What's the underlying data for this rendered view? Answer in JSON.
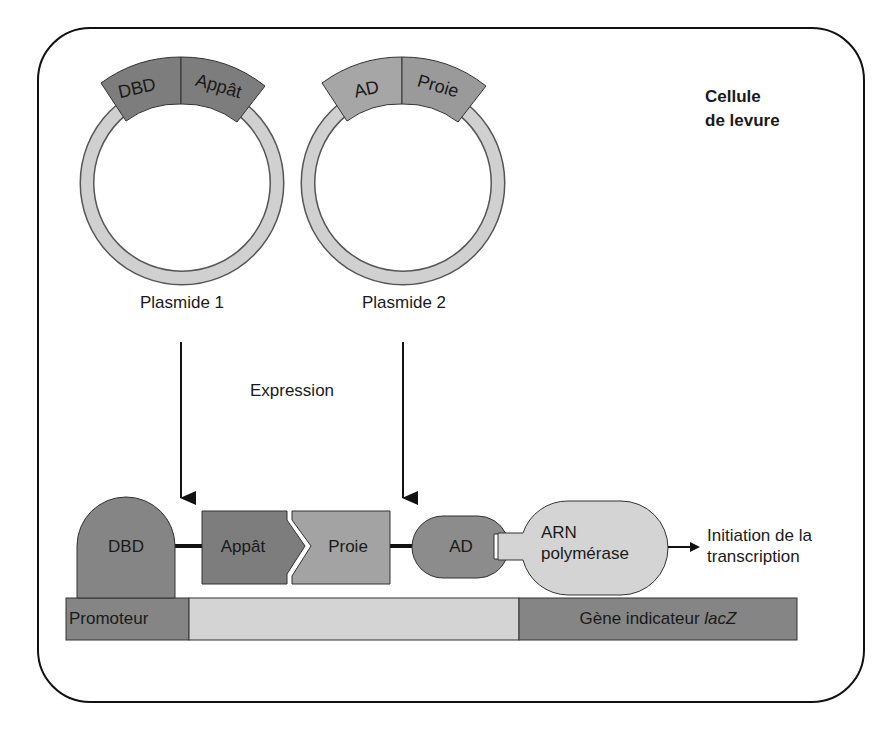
{
  "diagram": {
    "title_line1": "Cellule",
    "title_line2": "de levure",
    "plasmids": [
      {
        "label": "Plasmide 1",
        "segments": [
          "DBD",
          "Appât"
        ]
      },
      {
        "label": "Plasmide 2",
        "segments": [
          "AD",
          "Proie"
        ]
      }
    ],
    "step_label": "Expression",
    "complex": {
      "dbd": "DBD",
      "bait": "Appât",
      "prey": "Proie",
      "ad": "AD",
      "polymerase_line1": "ARN",
      "polymerase_line2": "polymérase"
    },
    "output_label_line1": "Initiation de la",
    "output_label_line2": "transcription",
    "dna": {
      "promoter": "Promoteur",
      "reporter_prefix": "Gène indicateur ",
      "reporter_gene": "lacZ"
    },
    "colors": {
      "dark_gray": "#7f7f7f",
      "mid_gray": "#999999",
      "light_gray": "#cfcfcf",
      "lighter_gray": "#d9d9d9",
      "outline": "#222222"
    }
  }
}
